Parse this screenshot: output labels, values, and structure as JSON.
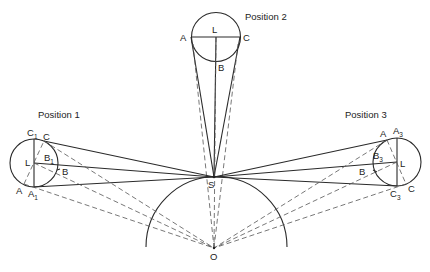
{
  "diagram": {
    "title_positions": [
      "Position 1",
      "Position 2",
      "Position 3"
    ],
    "points": {
      "S": "S",
      "O": "O"
    },
    "position1": {
      "label": "Position 1",
      "L": "L",
      "A": "A",
      "A_sub": "A",
      "A_sub_idx": "1",
      "C": "C",
      "C_sub": "C",
      "C_sub_idx": "1",
      "B": "B",
      "B_sub": "B",
      "B_sub_idx": "1"
    },
    "position2": {
      "label": "Position 2",
      "L": "L",
      "A": "A",
      "C": "C",
      "B": "B"
    },
    "position3": {
      "label": "Position 3",
      "L": "L",
      "A": "A",
      "A_sub": "A",
      "A_sub_idx": "3",
      "C": "C",
      "C_sub": "C",
      "C_sub_idx": "3",
      "B": "B",
      "B_sub": "B",
      "B_sub_idx": "3"
    },
    "colors": {
      "line": "#2a2a2a",
      "dashed": "#555555",
      "background": "#ffffff"
    }
  }
}
